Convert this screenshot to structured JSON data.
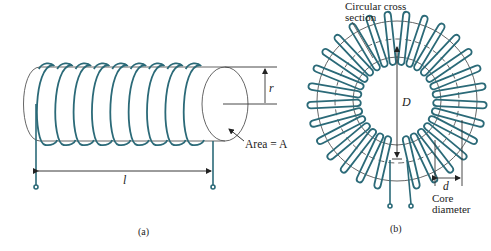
{
  "colors": {
    "wire": "#2b6a78",
    "outline": "#555555",
    "dim": "#333333",
    "background": "#ffffff"
  },
  "figure_a": {
    "caption": "(a)",
    "length_label": "l",
    "radius_label": "r",
    "area_label": "Area = A",
    "turns": 9
  },
  "figure_b": {
    "caption": "(b)",
    "cross_section_label_line1": "Circular cross",
    "cross_section_label_line2": "section",
    "diameter_label": "D",
    "core_diameter_symbol": "d",
    "core_diameter_line1": "Core",
    "core_diameter_line2": "diameter",
    "turns": 28
  }
}
